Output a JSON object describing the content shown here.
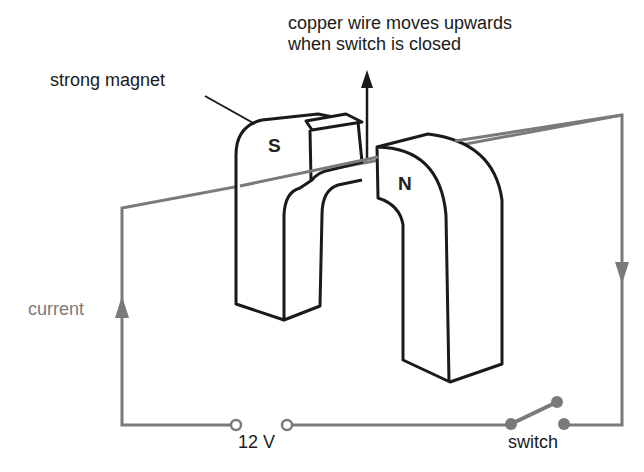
{
  "diagram": {
    "caption_line1": "copper wire moves upwards",
    "caption_line2": "when switch is closed",
    "magnet_label": "strong magnet",
    "current_label": "current",
    "voltage_label": "12 V",
    "switch_label": "switch",
    "south_pole": "S",
    "north_pole": "N",
    "colors": {
      "outline": "#1a1a1a",
      "wire": "#7a7a7a",
      "background": "#ffffff"
    }
  }
}
